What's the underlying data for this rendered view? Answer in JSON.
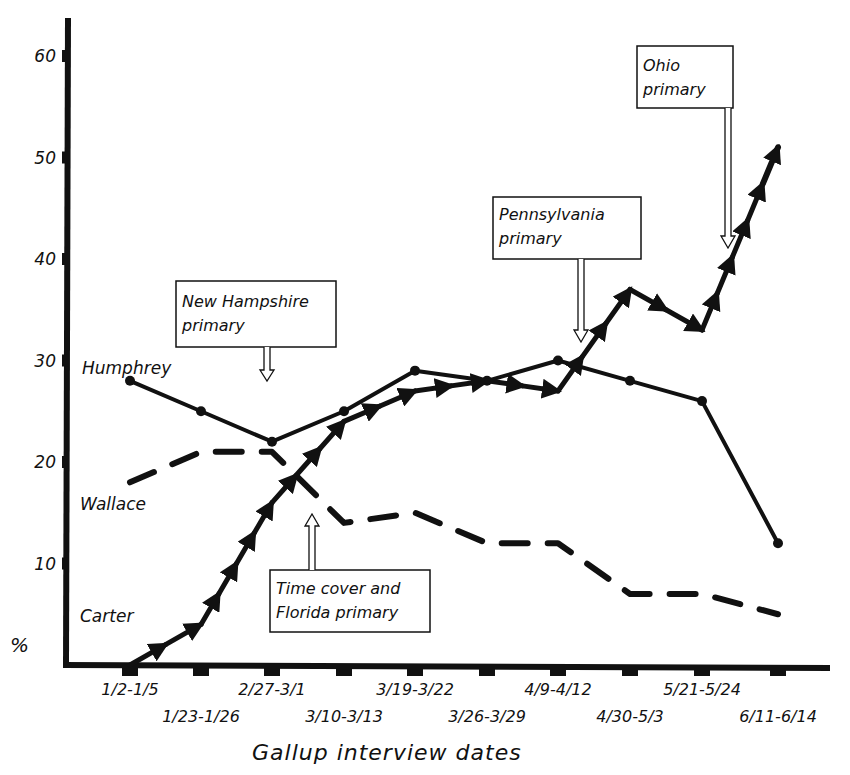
{
  "chart_data": {
    "type": "line",
    "title": "",
    "xlabel": "Gallup interview dates",
    "ylabel": "%",
    "ylim": [
      0,
      65
    ],
    "yticks": [
      10,
      20,
      30,
      40,
      50,
      60
    ],
    "grid": false,
    "legend": "inline labels at left of lines",
    "categories": [
      "1/2-1/5",
      "1/23-1/26",
      "2/27-3/1",
      "3/10-3/13",
      "3/19-3/22",
      "3/26-3/29",
      "4/9-4/12",
      "4/30-5/3",
      "5/21-5/24",
      "6/11-6/14"
    ],
    "series": [
      {
        "name": "Humphrey",
        "style": "solid-dots",
        "values": [
          28,
          25,
          22,
          25,
          29,
          28,
          30,
          28,
          26,
          12
        ]
      },
      {
        "name": "Wallace",
        "style": "dashed",
        "values": [
          18,
          21,
          21,
          14,
          15,
          12,
          12,
          7,
          7,
          5
        ]
      },
      {
        "name": "Carter",
        "style": "solid-arrows",
        "values": [
          0,
          4,
          16,
          24,
          27,
          28,
          27,
          37,
          33,
          51
        ]
      }
    ],
    "annotations": [
      {
        "text_line1": "New Hampshire",
        "text_line2": "primary",
        "points_to": "2/27-3/1 (before)",
        "arrow": "down"
      },
      {
        "text_line1": "Time cover and",
        "text_line2": "Florida primary",
        "points_to": "3/10-3/13 (before)",
        "arrow": "up"
      },
      {
        "text_line1": "Pennsylvania",
        "text_line2": "primary",
        "points_to": "4/9-4/12 (after)",
        "arrow": "down"
      },
      {
        "text_line1": "Ohio",
        "text_line2": "primary",
        "points_to": "5/21-5/24 (after)",
        "arrow": "down"
      }
    ]
  },
  "labels": {
    "y_unit": "%",
    "x_title": "Gallup interview dates",
    "series_humphrey": "Humphrey",
    "series_wallace": "Wallace",
    "series_carter": "Carter"
  }
}
